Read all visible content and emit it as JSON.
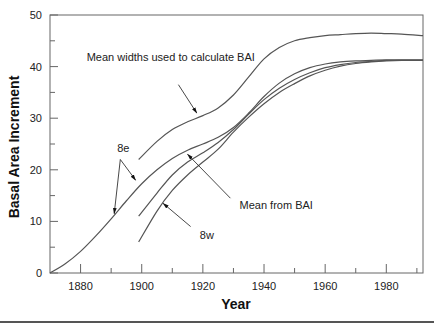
{
  "chart_data": {
    "type": "line",
    "title": "",
    "xlabel": "Year",
    "ylabel": "Basal Area Increment",
    "xlim": [
      1870,
      1992
    ],
    "ylim": [
      0,
      50
    ],
    "x_ticks_major": [
      1880,
      1900,
      1920,
      1940,
      1960,
      1980
    ],
    "x_ticks_minor": [
      1890,
      1910,
      1930,
      1950,
      1970,
      1990
    ],
    "y_ticks_major": [
      0,
      10,
      20,
      30,
      40,
      50
    ],
    "y_ticks_minor": [
      5,
      15,
      25,
      35,
      45
    ],
    "grid": false,
    "legend": null,
    "series": [
      {
        "name": "Mean widths used to calculate BAI",
        "x": [
          1899,
          1905,
          1910,
          1915,
          1920,
          1925,
          1930,
          1935,
          1940,
          1945,
          1950,
          1955,
          1960,
          1965,
          1970,
          1975,
          1980,
          1985,
          1992
        ],
        "y": [
          22,
          25.5,
          27.8,
          29.3,
          30.5,
          32,
          34.5,
          38,
          41.5,
          43.7,
          45,
          45.6,
          46,
          46.2,
          46.4,
          46.5,
          46.4,
          46.3,
          46.0
        ]
      },
      {
        "name": "8e",
        "x": [
          1870,
          1875,
          1880,
          1885,
          1890,
          1895,
          1900,
          1905,
          1910,
          1915,
          1920,
          1925,
          1930,
          1935,
          1940,
          1945,
          1950,
          1955,
          1960,
          1965,
          1970,
          1975,
          1980,
          1985,
          1992
        ],
        "y": [
          0,
          1.8,
          4.2,
          7.2,
          10.5,
          14,
          17.3,
          20,
          22.2,
          23.8,
          25,
          26.3,
          28.2,
          31,
          34.2,
          36.8,
          38.6,
          39.8,
          40.5,
          40.9,
          41.1,
          41.2,
          41.3,
          41.3,
          41.3
        ]
      },
      {
        "name": "Mean from BAI",
        "x": [
          1899,
          1905,
          1910,
          1915,
          1920,
          1925,
          1930,
          1935,
          1940,
          1945,
          1950,
          1955,
          1960,
          1965,
          1970,
          1975,
          1980,
          1985,
          1992
        ],
        "y": [
          11,
          15.5,
          19,
          21.5,
          23.3,
          25.3,
          27.8,
          30.8,
          33.6,
          35.8,
          37.5,
          38.8,
          39.8,
          40.4,
          40.8,
          41.0,
          41.2,
          41.2,
          41.2
        ]
      },
      {
        "name": "8w",
        "x": [
          1899,
          1905,
          1910,
          1915,
          1920,
          1925,
          1930,
          1935,
          1940,
          1945,
          1950,
          1955,
          1960,
          1965,
          1970,
          1975,
          1980,
          1985,
          1992
        ],
        "y": [
          6,
          12,
          16,
          19,
          21.5,
          24,
          27.3,
          30.2,
          32.8,
          35,
          36.7,
          38.2,
          39.3,
          40.1,
          40.6,
          40.9,
          41.1,
          41.2,
          41.2
        ]
      }
    ],
    "annotations": [
      {
        "text": "Mean widths used to calculate BAI",
        "label_x": 1882,
        "label_y": 41,
        "arrow_from": [
          1912,
          36.5
        ],
        "arrow_to": [
          1918,
          31
        ]
      },
      {
        "text": "8e",
        "label_x": 1892,
        "label_y": 23.5,
        "arrow_to": [
          [
            1891,
            11.5
          ],
          [
            1898,
            18
          ]
        ]
      },
      {
        "text": "Mean from BAI",
        "label_x": 1932,
        "label_y": 12.5,
        "arrow_from": [
          1929,
          14.5
        ],
        "arrow_to": [
          1915,
          23
        ]
      },
      {
        "text": "8w",
        "label_x": 1919,
        "label_y": 6.5,
        "arrow_from": [
          1916,
          9
        ],
        "arrow_to": [
          1907,
          13.5
        ]
      }
    ]
  }
}
